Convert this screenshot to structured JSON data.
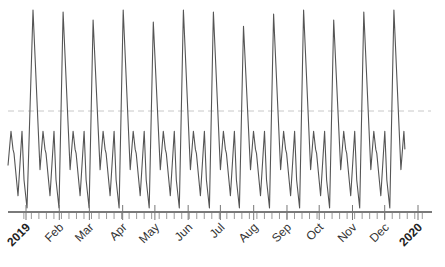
{
  "chart_data": {
    "type": "line",
    "title": "",
    "xlabel": "",
    "ylabel": "",
    "grid": false,
    "legend": null,
    "x_range": [
      "2019-01-01",
      "2020-01-01"
    ],
    "ylim": [
      0,
      100
    ],
    "reference_line": {
      "value": 50,
      "style": "dashed",
      "color": "#c8c8c8"
    },
    "x_tick_labels": [
      {
        "label": "2019",
        "bold": true
      },
      {
        "label": "Feb",
        "bold": false
      },
      {
        "label": "Mar",
        "bold": false
      },
      {
        "label": "Apr",
        "bold": false
      },
      {
        "label": "May",
        "bold": false
      },
      {
        "label": "Jun",
        "bold": false
      },
      {
        "label": "Jul",
        "bold": false
      },
      {
        "label": "Aug",
        "bold": false
      },
      {
        "label": "Sep",
        "bold": false
      },
      {
        "label": "Oct",
        "bold": false
      },
      {
        "label": "Nov",
        "bold": false
      },
      {
        "label": "Dec",
        "bold": false
      },
      {
        "label": "2020",
        "bold": true
      }
    ],
    "cycle_period_days": 28,
    "cycle_peaks": [
      100,
      99,
      95,
      100,
      94,
      100,
      99,
      92,
      98,
      100,
      95,
      99,
      100
    ],
    "cycle_shape": [
      {
        "offset": 0,
        "value": "peak"
      },
      {
        "offset": 7,
        "value": 21
      },
      {
        "offset": 10,
        "value": 40
      },
      {
        "offset": 12,
        "value": 31
      },
      {
        "offset": 13,
        "value": 29
      },
      {
        "offset": 17,
        "value": 8
      },
      {
        "offset": 21,
        "value": 40
      },
      {
        "offset": 23,
        "value": 16
      },
      {
        "offset": 26,
        "value": 2
      }
    ],
    "leading_points": [
      {
        "offset": -25,
        "value": 23
      },
      {
        "offset": -22,
        "value": 40
      },
      {
        "offset": -20,
        "value": 31
      },
      {
        "offset": -19,
        "value": 29
      },
      {
        "offset": -15,
        "value": 8
      },
      {
        "offset": -11,
        "value": 40
      },
      {
        "offset": -9,
        "value": 16
      },
      {
        "offset": -6,
        "value": 2
      }
    ],
    "trailing_points": [
      {
        "offset": 7,
        "value": 21
      },
      {
        "offset": 10,
        "value": 40
      },
      {
        "offset": 11,
        "value": 31
      }
    ],
    "series": [
      {
        "name": "series",
        "color": "#555555"
      }
    ]
  }
}
